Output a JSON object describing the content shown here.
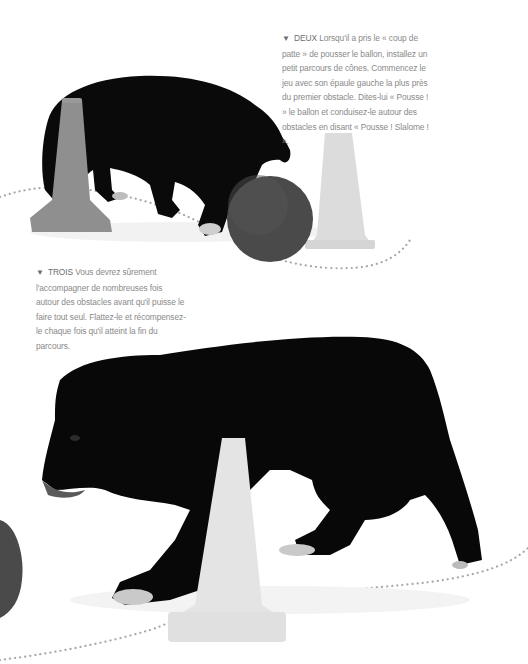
{
  "page": {
    "type": "book-page",
    "background": "#ffffff"
  },
  "captions": [
    {
      "id": "deux",
      "bullet_icon": "triangle-down-icon",
      "bullet_glyph": "▼",
      "lead": "DEUX",
      "text": "Lorsqu'il a pris le « coup de patte » de pousser le ballon, installez un petit parcours de cônes. Commencez le jeu avec son épaule gauche la plus près du premier obstacle. Dites-lui « Pousse ! » le ballon et conduisez-le autour des obstacles en disant « Pousse ! Slalome ! »."
    },
    {
      "id": "trois",
      "bullet_icon": "triangle-down-icon",
      "bullet_glyph": "▼",
      "lead": "TROIS",
      "text": "Vous devrez sûrement l'accompagner de nombreuses fois autour des obstacles avant qu'il puisse le faire tout seul. Flattez-le et récompensez-le chaque fois qu'il atteint la fin du parcours."
    }
  ],
  "illustrations": {
    "top": {
      "subject": "black dog pushing ball between cones",
      "cone_left_color": "#8f8f8f",
      "cone_right_color": "#dcdcdc",
      "ball_color": "#4a4a4a"
    },
    "bottom": {
      "subject": "black dog walking around a cone",
      "cone_color": "#e4e4e4",
      "ball_partial_color": "#4a4a4a"
    },
    "path_dots_color": "#a8a8a8"
  }
}
